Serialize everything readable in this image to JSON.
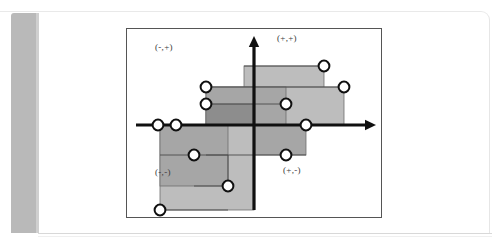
{
  "page": {
    "kind": "scanned-book-page",
    "background_color": "#ffffff",
    "binding_bar_color": "#b9b9b9",
    "rule_color": "#d8d8d8"
  },
  "figure": {
    "frame_color": "#555555",
    "frame": {
      "x": 0,
      "y": 0,
      "width": 256,
      "height": 190
    },
    "axes": {
      "origin": {
        "x": 128,
        "y": 97
      },
      "color": "#101010",
      "stroke_width": 3.2,
      "x_axis": {
        "x1": 10,
        "y1": 97,
        "x2": 250,
        "y2": 97,
        "arrow": "right"
      },
      "y_axis": {
        "x1": 128,
        "y1": 182,
        "x2": 128,
        "y2": 8,
        "arrow": "up"
      }
    },
    "quadrant_labels": [
      {
        "name": "upper-left",
        "text": "(-,+)"
      },
      {
        "name": "upper-right",
        "text": "(+,+)"
      },
      {
        "name": "lower-left",
        "text": "(-,-)"
      },
      {
        "name": "lower-right",
        "text": "(+,-)"
      }
    ],
    "rect_fill_light": "#bdbdbd",
    "rect_fill_mid": "#a6a6a6",
    "rect_fill_dark": "#8d8d8d",
    "rect_stroke": "#6e6e6e",
    "node_fill": "#ffffff",
    "node_stroke": "#101010",
    "node_radius": 5.4,
    "rectangles": [
      {
        "name": "rect-upper-right-tall",
        "x": 118,
        "y": 38,
        "width": 80,
        "height": 59,
        "shade": "light"
      },
      {
        "name": "rect-upper-right-wide",
        "x": 80,
        "y": 59,
        "width": 138,
        "height": 38,
        "shade": "light"
      },
      {
        "name": "rect-upper-mid",
        "x": 80,
        "y": 59,
        "width": 80,
        "height": 38,
        "shade": "mid"
      },
      {
        "name": "rect-core-dark",
        "x": 80,
        "y": 76,
        "width": 48,
        "height": 21,
        "shade": "dark"
      },
      {
        "name": "rect-lower-right",
        "x": 80,
        "y": 97,
        "width": 100,
        "height": 30,
        "shade": "mid"
      },
      {
        "name": "rect-lower-left-tall",
        "x": 34,
        "y": 97,
        "width": 94,
        "height": 85,
        "shade": "light"
      },
      {
        "name": "rect-lower-left-inner",
        "x": 34,
        "y": 97,
        "width": 68,
        "height": 61,
        "shade": "mid"
      }
    ],
    "connectors": [
      {
        "name": "connector-upper-right-top",
        "x1": 118,
        "y1": 38,
        "x2": 198,
        "y2": 38
      },
      {
        "name": "connector-upper-wide-top",
        "x1": 80,
        "y1": 59,
        "x2": 218,
        "y2": 59
      },
      {
        "name": "connector-upper-mid",
        "x1": 80,
        "y1": 76,
        "x2": 160,
        "y2": 76
      },
      {
        "name": "connector-lower-right",
        "x1": 80,
        "y1": 127,
        "x2": 180,
        "y2": 127
      },
      {
        "name": "connector-lower-left-in",
        "x1": 34,
        "y1": 127,
        "x2": 102,
        "y2": 127
      },
      {
        "name": "connector-lower-left-out",
        "x1": 34,
        "y1": 182,
        "x2": 102,
        "y2": 182
      },
      {
        "name": "connector-lower-inner-v",
        "x1": 102,
        "y1": 127,
        "x2": 102,
        "y2": 158
      },
      {
        "name": "connector-lower-inner-h",
        "x1": 68,
        "y1": 158,
        "x2": 102,
        "y2": 158
      },
      {
        "name": "connector-axis-left",
        "x1": 32,
        "y1": 97,
        "x2": 50,
        "y2": 97
      }
    ],
    "nodes": [
      {
        "name": "node-axis-left-outer",
        "x": 32,
        "y": 97
      },
      {
        "name": "node-axis-left-inner",
        "x": 50,
        "y": 97
      },
      {
        "name": "node-upper-left-high",
        "x": 80,
        "y": 59
      },
      {
        "name": "node-upper-left-mid",
        "x": 80,
        "y": 76
      },
      {
        "name": "node-upper-mid-right",
        "x": 160,
        "y": 76
      },
      {
        "name": "node-upper-right-top",
        "x": 198,
        "y": 38
      },
      {
        "name": "node-upper-right-far",
        "x": 218,
        "y": 59
      },
      {
        "name": "node-axis-right",
        "x": 180,
        "y": 97
      },
      {
        "name": "node-lower-right",
        "x": 160,
        "y": 127
      },
      {
        "name": "node-lower-left-in",
        "x": 68,
        "y": 127
      },
      {
        "name": "node-lower-inner",
        "x": 102,
        "y": 158
      },
      {
        "name": "node-lower-left-out",
        "x": 34,
        "y": 182
      }
    ]
  }
}
